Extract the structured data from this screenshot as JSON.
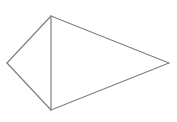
{
  "diagram": {
    "type": "kite",
    "label_fragment": "",
    "stroke_color": "#808080",
    "background_color": "#ffffff",
    "stroke_width": 1.2,
    "vertices": {
      "top": [
        51,
        16
      ],
      "left": [
        7,
        63
      ],
      "right": [
        169,
        63
      ],
      "bottom": [
        51,
        110
      ]
    },
    "edges": [
      {
        "from": "top",
        "to": "left"
      },
      {
        "from": "left",
        "to": "bottom"
      },
      {
        "from": "top",
        "to": "right"
      },
      {
        "from": "right",
        "to": "bottom"
      },
      {
        "from": "top",
        "to": "bottom"
      }
    ]
  }
}
